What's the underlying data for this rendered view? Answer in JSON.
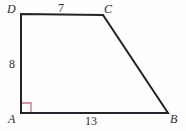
{
  "figure": {
    "kind": "right-trapezoid-diagram",
    "background_color": "#fefefe",
    "stroke_color": "#23232b",
    "right_angle_color": "#c4737f",
    "stroke_width": 2,
    "vertices": [
      {
        "name": "D",
        "label": "D",
        "x": 21,
        "y": 14
      },
      {
        "name": "C",
        "label": "C",
        "x": 103,
        "y": 15
      },
      {
        "name": "B",
        "label": "B",
        "x": 168,
        "y": 113
      },
      {
        "name": "A",
        "label": "A",
        "x": 21,
        "y": 113
      }
    ],
    "sides": [
      {
        "name": "DC",
        "label": "7",
        "position": "top"
      },
      {
        "name": "DA",
        "label": "8",
        "position": "left"
      },
      {
        "name": "AB",
        "label": "13",
        "position": "bottom"
      },
      {
        "name": "CB",
        "label": "",
        "position": "slant"
      }
    ],
    "right_angle": {
      "at_vertex": "A",
      "size": 9
    },
    "path": "M 21 14 L 103 15 L 168 113 L 21 113 Z"
  }
}
